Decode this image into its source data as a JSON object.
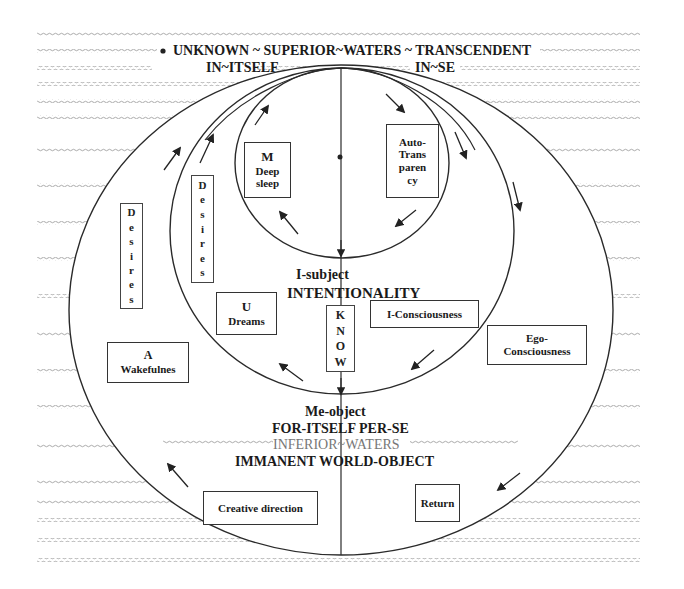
{
  "diagram": {
    "top": {
      "line1": "UNKNOWN ~ SUPERIOR~WATERS ~ TRANSCENDENT",
      "in_itself": "IN~ITSELF",
      "in_se": "IN~SE"
    },
    "inner_circle": {
      "m_box": {
        "letter": "M",
        "line1": "Deep",
        "line2": "sleep"
      },
      "auto_box": {
        "lines": [
          "Auto-",
          "Trans",
          "paren",
          "cy"
        ]
      }
    },
    "middle": {
      "subject": "I-subject",
      "intentionality": "INTENTIONALITY",
      "u_box": {
        "letter": "U",
        "line1": "Dreams"
      },
      "know_box": {
        "letters": [
          "K",
          "N",
          "O",
          "W"
        ]
      },
      "i_consciousness": "I-Consciousness",
      "desires_inner": {
        "letters": [
          "D",
          "e",
          "s",
          "i",
          "r",
          "e",
          "s"
        ]
      }
    },
    "outer": {
      "desires_outer": {
        "letters": [
          "D",
          "e",
          "s",
          "i",
          "r",
          "e",
          "s"
        ]
      },
      "a_box": {
        "letter": "A",
        "line1": "Wakefulnes"
      },
      "ego_box": {
        "line1": "Ego-",
        "line2": "Consciousness"
      },
      "me_object": "Me-object",
      "for_itself": "FOR-ITSELF PER-SE",
      "inferior_waters": "INFERIOR~WATERS",
      "immanent": "IMMANENT WORLD-OBJECT",
      "creative_direction": "Creative direction",
      "return": "Return"
    },
    "colors": {
      "line": "#2a2a2a",
      "wave": "#9a9a9a",
      "text": "#1a1a1a",
      "muted_text": "#7a7a7a"
    }
  }
}
